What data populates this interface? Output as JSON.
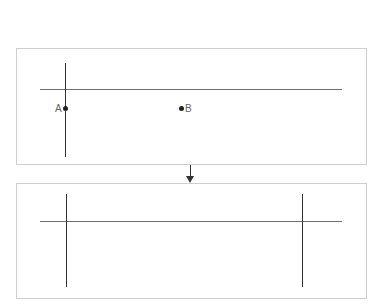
{
  "diagram": {
    "top_panel": {
      "points": [
        {
          "label": "A"
        },
        {
          "label": "B"
        }
      ]
    },
    "bottom_panel": {},
    "colors": {
      "panel_border": "#cfcfcf",
      "line": "#333333",
      "horizontal_line": "#6e6e6e",
      "label": "#666666"
    }
  }
}
